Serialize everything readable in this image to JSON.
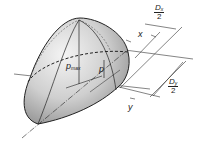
{
  "diagram": {
    "title": "",
    "type": "contact pressure distribution (semi-ellipsoid)",
    "labels": {
      "p_max": {
        "base": "p",
        "sub": "max"
      },
      "p": "p",
      "x": "x",
      "y": "y",
      "dx_half": {
        "numerator_base": "D",
        "numerator_sub": "x",
        "denominator": "2"
      },
      "dy_half": {
        "numerator_base": "D",
        "numerator_sub": "y",
        "denominator": "2"
      }
    },
    "colors": {
      "surface_light": "#f2f2f2",
      "surface_dark": "#9a9a9a",
      "line": "#222222"
    }
  }
}
